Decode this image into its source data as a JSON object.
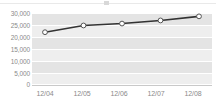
{
  "chart_data": {
    "type": "line",
    "title": "",
    "xlabel": "",
    "ylabel": "",
    "categories": [
      "12/04",
      "12/05",
      "12/06",
      "12/07",
      "12/08"
    ],
    "series": [
      {
        "name": "series-1",
        "values": [
          22000,
          24800,
          25600,
          26900,
          28600
        ]
      }
    ],
    "ylim": [
      0,
      30000
    ],
    "yticks": [
      0,
      5000,
      10000,
      15000,
      20000,
      25000,
      30000
    ],
    "ytick_labels": [
      "0",
      "5,000",
      "10,000",
      "15,000",
      "20,000",
      "25,000",
      "30,000"
    ],
    "grid": true,
    "grid_color": "#ffffff",
    "plot_background": "#eeeeee",
    "band_color": "#e4e4e4",
    "legend": "none",
    "line_color": "#333333",
    "marker_fill": "#ffffff",
    "marker_edge": "#555555",
    "tick_label_color": "#8a8a8a"
  },
  "axes": {
    "y_labels": [
      {
        "text": "30,000",
        "value": 30000
      },
      {
        "text": "25,000",
        "value": 25000
      },
      {
        "text": "20,000",
        "value": 20000
      },
      {
        "text": "15,000",
        "value": 15000
      },
      {
        "text": "10,000",
        "value": 10000
      },
      {
        "text": "5,000",
        "value": 5000
      },
      {
        "text": "0",
        "value": 0
      }
    ],
    "x_labels": [
      {
        "text": "12/04"
      },
      {
        "text": "12/05"
      },
      {
        "text": "12/06"
      },
      {
        "text": "12/07"
      },
      {
        "text": "12/08"
      }
    ]
  }
}
